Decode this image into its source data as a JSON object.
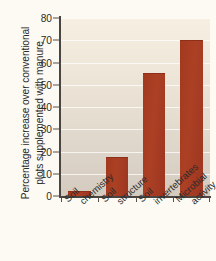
{
  "chart_data": {
    "type": "bar",
    "title": "",
    "xlabel": "",
    "ylabel_line1": "Percentage increase over conventional",
    "ylabel_line2": "plots supplemented with manure",
    "categories": [
      "Soil chemistry",
      "Soil structure",
      "Soil invertebrates",
      "Microbial activity"
    ],
    "category_lines": [
      [
        "Soil",
        "chemistry"
      ],
      [
        "Soil",
        "structure"
      ],
      [
        "Soil",
        "invertebrates"
      ],
      [
        "Microbial",
        "activity"
      ]
    ],
    "values": [
      2,
      17,
      55,
      69.5
    ],
    "ylim": [
      0,
      80
    ],
    "ytick_values": [
      0,
      10,
      20,
      30,
      40,
      50,
      60,
      70,
      80
    ],
    "ytick_labels": [
      "0",
      "10",
      "20",
      "30",
      "40",
      "50",
      "60",
      "70",
      "80"
    ],
    "grid": true,
    "legend": "none",
    "bar_color": "#a53d21",
    "plot_background_top": "#f6efe2",
    "plot_background_bottom": "#d4cabe",
    "axis_color": "#4a4540",
    "page_background": "#fdfaf3"
  }
}
